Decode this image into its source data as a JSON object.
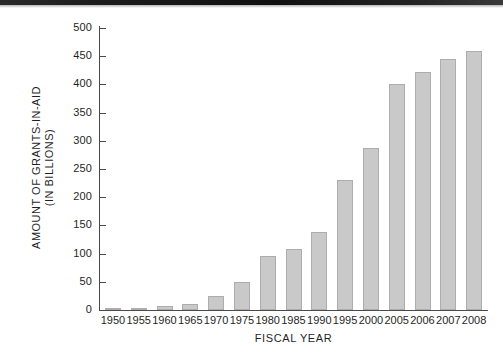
{
  "chart_data": {
    "type": "bar",
    "title": "",
    "xlabel": "FISCAL YEAR",
    "ylabel_line1": "AMOUNT OF GRANTS-IN-AID",
    "ylabel_line2": "(IN BILLIONS)",
    "categories": [
      "1950",
      "1955",
      "1960",
      "1965",
      "1970",
      "1975",
      "1980",
      "1985",
      "1990",
      "1995",
      "2000",
      "2005",
      "2006",
      "2007",
      "2008"
    ],
    "values": [
      2,
      3,
      7,
      11,
      24,
      50,
      96,
      108,
      139,
      230,
      288,
      400,
      422,
      445,
      460
    ],
    "ylim": [
      0,
      500
    ],
    "ytick_labels": [
      "0",
      "50",
      "100",
      "150",
      "200",
      "250",
      "300",
      "350",
      "400",
      "450",
      "500"
    ],
    "ytick_values": [
      0,
      50,
      100,
      150,
      200,
      250,
      300,
      350,
      400,
      450,
      500
    ],
    "grid": false,
    "legend": "none",
    "bar_color": "#c9c9c9",
    "bar_border_color": "#adadad",
    "axis_color": "#4a4a4a",
    "background_color": "#ffffff"
  }
}
